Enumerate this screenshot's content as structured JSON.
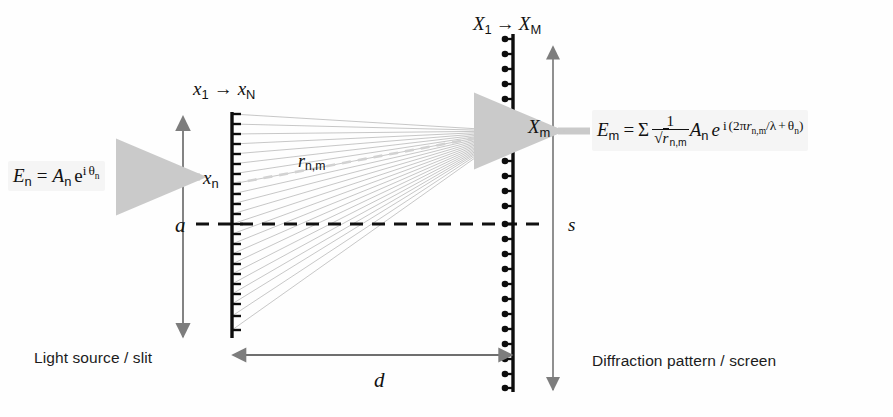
{
  "figure": {
    "kind": "optics-diagram",
    "background_color": "#ffffff",
    "ray_color": "#b9b9b9",
    "line_color": "#111111",
    "arrow_color": "#7d7d7d",
    "highlight_arrow_color": "#c9c9c9"
  },
  "labels": {
    "slit_range": {
      "start": "x",
      "start_sub": "1",
      "arrow": "→",
      "end": "x",
      "end_sub": "N"
    },
    "screen_range": {
      "start": "X",
      "start_sub": "1",
      "arrow": "→",
      "end": "X",
      "end_sub": "M"
    },
    "slit_point": {
      "symbol": "x",
      "sub": "n"
    },
    "screen_point": {
      "symbol": "X",
      "sub": "m"
    },
    "ray_label": {
      "symbol": "r",
      "sub": "n,m"
    },
    "slit_height": "a",
    "screen_height": "s",
    "separation": "d"
  },
  "equations": {
    "source": {
      "lhs": "E",
      "lhs_sub": "n",
      "eq": "=",
      "amplitude": "A",
      "amplitude_sub": "n",
      "exp_base": "e",
      "exp_i": "i",
      "exp_theta": "θ",
      "exp_theta_sub": "n",
      "plain": "E_n = A_n e^(i θ_n)"
    },
    "screen": {
      "lhs": "E",
      "lhs_sub": "m",
      "eq": "=",
      "sum": "Σ",
      "frac_num": "1",
      "frac_den_radical": "√",
      "frac_den_radicand": "r",
      "frac_den_radicand_sub": "n,m",
      "amplitude": "A",
      "amplitude_sub": "n",
      "exp_base": "e",
      "exp_i": "i",
      "exp_open": "(",
      "exp_two_pi": "2π",
      "exp_r": "r",
      "exp_r_sub": "n,m",
      "exp_over_lambda": "/λ",
      "exp_plus": "+",
      "exp_theta": "θ",
      "exp_theta_sub": "n",
      "exp_close": ")",
      "plain": "E_m = Σ (1/√(r_n,m)) A_n e^(i(2π r_n,m/λ + θ_n))"
    }
  },
  "captions": {
    "left": "Light source / slit",
    "right": "Diffraction pattern / screen"
  },
  "geometry": {
    "slit_x": 232,
    "slit_top": 112,
    "slit_bottom": 338,
    "slit_tick_count": 22,
    "screen_x": 513,
    "screen_top": 34,
    "screen_bottom": 392,
    "screen_tick_count": 24,
    "converge_x": 513,
    "converge_y": 131,
    "axis_y": 224,
    "axis_x_start": 196,
    "axis_x_end": 545,
    "ray_count": 22,
    "a_arrow_x": 183,
    "a_arrow_top": 117,
    "a_arrow_bottom": 337,
    "s_arrow_x": 553,
    "s_arrow_top": 47,
    "s_arrow_bottom": 390,
    "d_arrow_y": 355,
    "d_arrow_x_start": 233,
    "d_arrow_x_end": 512
  }
}
